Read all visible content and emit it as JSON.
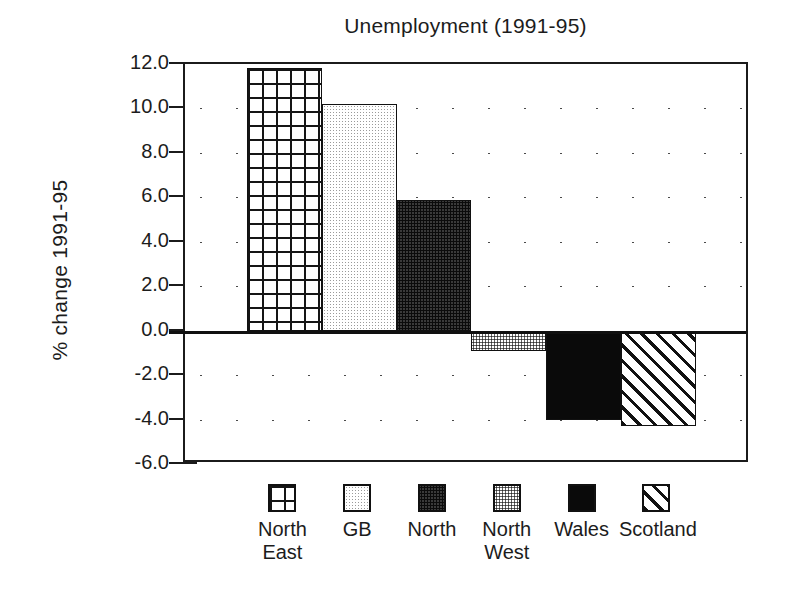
{
  "chart_data": {
    "type": "bar",
    "title": "Unemployment (1991-95)",
    "xlabel": "",
    "ylabel": "% change 1991-95",
    "categories": [
      "North East",
      "GB",
      "North",
      "North West",
      "Wales",
      "Scotland"
    ],
    "values": [
      11.8,
      10.2,
      5.9,
      -0.9,
      -4.0,
      -4.3
    ],
    "ylim": [
      -6.0,
      12.0
    ],
    "ytick_labels": [
      "12.0",
      "10.0",
      "8.0",
      "6.0",
      "4.0",
      "2.0",
      "0.0",
      "-2.0",
      "-4.0",
      "-6.0"
    ],
    "ytick_values": [
      12.0,
      10.0,
      8.0,
      6.0,
      4.0,
      2.0,
      0.0,
      -2.0,
      -4.0,
      -6.0
    ],
    "grid": "horizontal-dotted",
    "legend_position": "below",
    "series": [
      {
        "name": "North East",
        "value": 11.8,
        "pattern": "crosshatch-grid"
      },
      {
        "name": "GB",
        "value": 10.2,
        "pattern": "light-stipple"
      },
      {
        "name": "North",
        "value": 5.9,
        "pattern": "dark-stipple"
      },
      {
        "name": "North West",
        "value": -0.9,
        "pattern": "medium-stipple"
      },
      {
        "name": "Wales",
        "value": -4.0,
        "pattern": "solid-black"
      },
      {
        "name": "Scotland",
        "value": -4.3,
        "pattern": "diagonal-hatch"
      }
    ]
  },
  "legend": {
    "items": [
      {
        "label": "North\nEast",
        "swatch": "crosshatch-grid-swatch"
      },
      {
        "label": "GB",
        "swatch": "light-stipple-swatch"
      },
      {
        "label": "North",
        "swatch": "dark-stipple-swatch"
      },
      {
        "label": "North\nWest",
        "swatch": "medium-stipple-swatch"
      },
      {
        "label": "Wales",
        "swatch": "solid-black-swatch"
      },
      {
        "label": "Scotland",
        "swatch": "diagonal-hatch-swatch"
      }
    ]
  },
  "colors": {
    "axis": "#1b1b1b",
    "text": "#1c1c1c",
    "grid_dot": "#4a4a4a",
    "background": "#ffffff"
  }
}
